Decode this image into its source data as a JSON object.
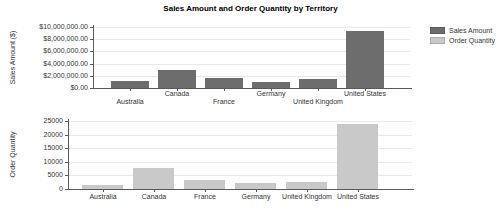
{
  "title": "Sales Amount and Order Quantity by Territory",
  "legend": {
    "items": [
      {
        "label": "Sales Amount",
        "color": "#6d6d6d"
      },
      {
        "label": "Order Quantity",
        "color": "#c9c9c9"
      }
    ]
  },
  "chart_data": [
    {
      "type": "bar",
      "name": "Sales Amount",
      "title": "Sales Amount and Order Quantity by Territory",
      "xlabel": "",
      "ylabel": "Sales Amount ($)",
      "categories": [
        "Australia",
        "Canada",
        "France",
        "Germany",
        "United Kingdom",
        "United States"
      ],
      "values": [
        1150000,
        2950000,
        1650000,
        1050000,
        1450000,
        9390000
      ],
      "ylim": [
        0,
        10000000
      ],
      "grid": true,
      "legend_position": "top-right",
      "bar_color": "#6d6d6d",
      "yticks": [
        {
          "value": 0,
          "label": "$0.00"
        },
        {
          "value": 2000000,
          "label": "$2,000,000.00"
        },
        {
          "value": 4000000,
          "label": "$4,000,000.00"
        },
        {
          "value": 6000000,
          "label": "$6,000,000.00"
        },
        {
          "value": 8000000,
          "label": "$8,000,000.00"
        },
        {
          "value": 10000000,
          "label": "$10,000,000.00"
        }
      ]
    },
    {
      "type": "bar",
      "name": "Order Quantity",
      "title": "",
      "xlabel": "",
      "ylabel": "Order Quantity",
      "categories": [
        "Australia",
        "Canada",
        "France",
        "Germany",
        "United Kingdom",
        "United States"
      ],
      "values": [
        1400,
        7800,
        3200,
        2100,
        2700,
        23800
      ],
      "ylim": [
        0,
        25000
      ],
      "grid": true,
      "bar_color": "#c9c9c9",
      "yticks": [
        {
          "value": 0,
          "label": "0"
        },
        {
          "value": 5000,
          "label": "5000"
        },
        {
          "value": 10000,
          "label": "10000"
        },
        {
          "value": 15000,
          "label": "15000"
        },
        {
          "value": 20000,
          "label": "20000"
        },
        {
          "value": 25000,
          "label": "25000"
        }
      ]
    }
  ]
}
